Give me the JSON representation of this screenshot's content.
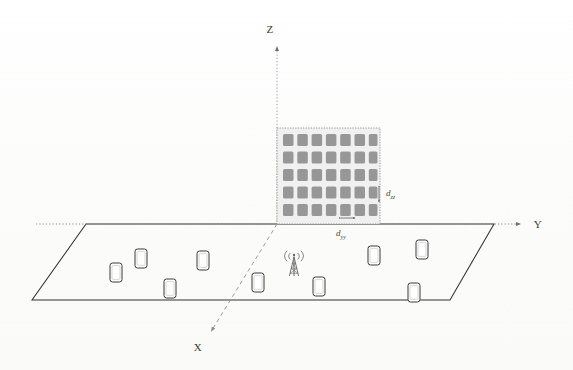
{
  "figure": {
    "type": "3d-system-model-diagram"
  },
  "axes": {
    "z": {
      "label": "Z",
      "style": "dotted",
      "direction": "up",
      "arrow": true
    },
    "y": {
      "label": "Y",
      "style": "dotted",
      "direction": "right",
      "arrow": true
    },
    "x": {
      "label": "X",
      "style": "dashed",
      "direction": "down-left",
      "arrow": true
    }
  },
  "array": {
    "name": "uniform-planar-antenna-array",
    "columns": 7,
    "rows": 5,
    "element_count": 35,
    "plane": "YZ",
    "panel_fill": "#efefef",
    "element_fill": "#9a9a9a",
    "border_style": "dotted"
  },
  "dimensions": {
    "vertical": {
      "label": "d",
      "subscript": "zz"
    },
    "horizontal": {
      "label": "d",
      "subscript": "yy"
    }
  },
  "ground_plane": {
    "name": "user-ground-plane",
    "shape": "parallelogram",
    "stroke": "#333333",
    "fill": "none"
  },
  "base_station": {
    "name": "base-station-tower",
    "icon": "cell-tower-icon"
  },
  "user_equipments": {
    "count": 9,
    "icon": "mobile-phone-icon",
    "items": [
      {
        "id": "ue-1",
        "x": 116,
        "y": 272
      },
      {
        "id": "ue-2",
        "x": 141,
        "y": 259
      },
      {
        "id": "ue-3",
        "x": 170,
        "y": 288
      },
      {
        "id": "ue-4",
        "x": 203,
        "y": 261
      },
      {
        "id": "ue-5",
        "x": 319,
        "y": 286
      },
      {
        "id": "ue-6",
        "x": 374,
        "y": 256
      },
      {
        "id": "ue-7",
        "x": 422,
        "y": 250
      },
      {
        "id": "ue-8",
        "x": 414,
        "y": 292
      },
      {
        "id": "ue-9",
        "x": 303,
        "y": 258
      }
    ]
  }
}
